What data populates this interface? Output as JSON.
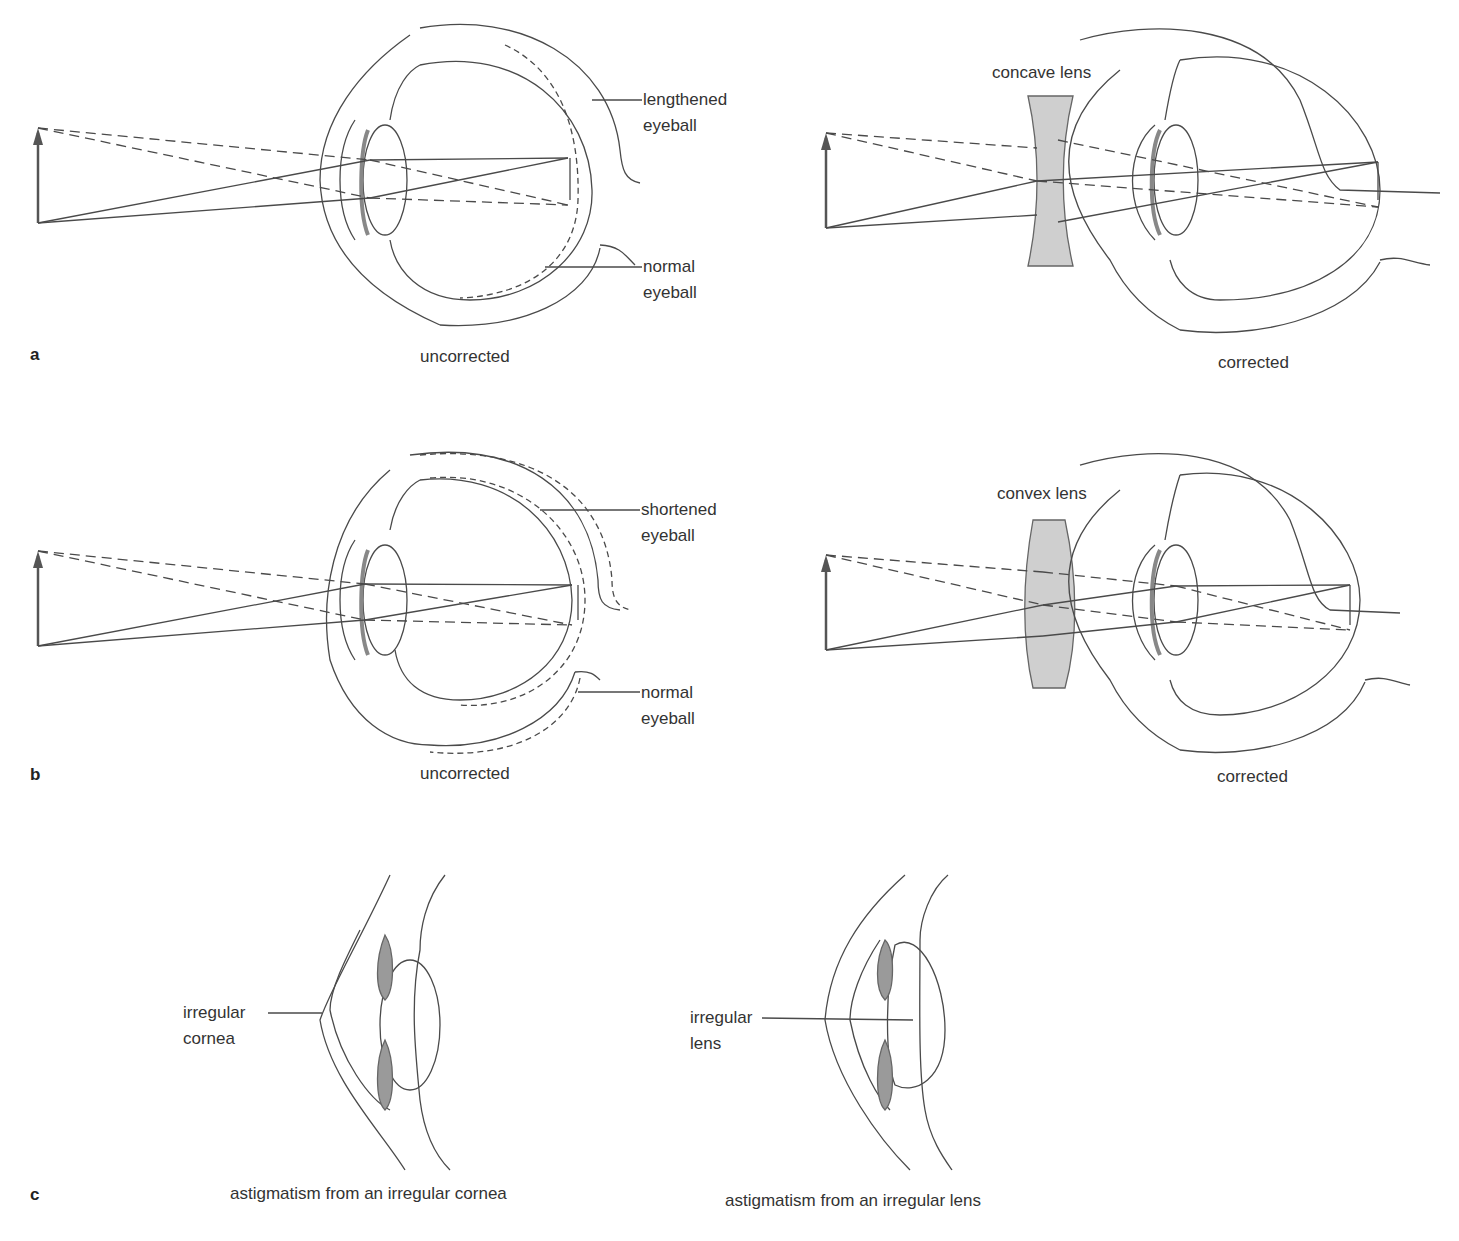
{
  "figure": {
    "panels": [
      {
        "letter": "a",
        "condition": "nearsightedness (myopia)",
        "left": {
          "caption": "uncorrected",
          "labels": {
            "top": [
              "lengthened",
              "eyeball"
            ],
            "bottom": [
              "normal",
              "eyeball"
            ]
          }
        },
        "right": {
          "caption": "corrected",
          "lens_label": "concave lens"
        }
      },
      {
        "letter": "b",
        "condition": "farsightedness (hyperopia)",
        "left": {
          "caption": "uncorrected",
          "labels": {
            "top": [
              "shortened",
              "eyeball"
            ],
            "bottom": [
              "normal",
              "eyeball"
            ]
          }
        },
        "right": {
          "caption": "corrected",
          "lens_label": "convex lens"
        }
      },
      {
        "letter": "c",
        "condition": "astigmatism",
        "left": {
          "caption": "astigmatism from an irregular cornea",
          "labels": {
            "pointer": [
              "irregular",
              "cornea"
            ]
          }
        },
        "right": {
          "caption": "astigmatism from an irregular lens",
          "labels": {
            "pointer": [
              "irregular",
              "lens"
            ]
          }
        }
      }
    ],
    "colors": {
      "line": "#4a4a4a",
      "lens_fill": "#cfcfcf",
      "iris_fill": "#9a9a9a",
      "background": "#ffffff"
    }
  }
}
